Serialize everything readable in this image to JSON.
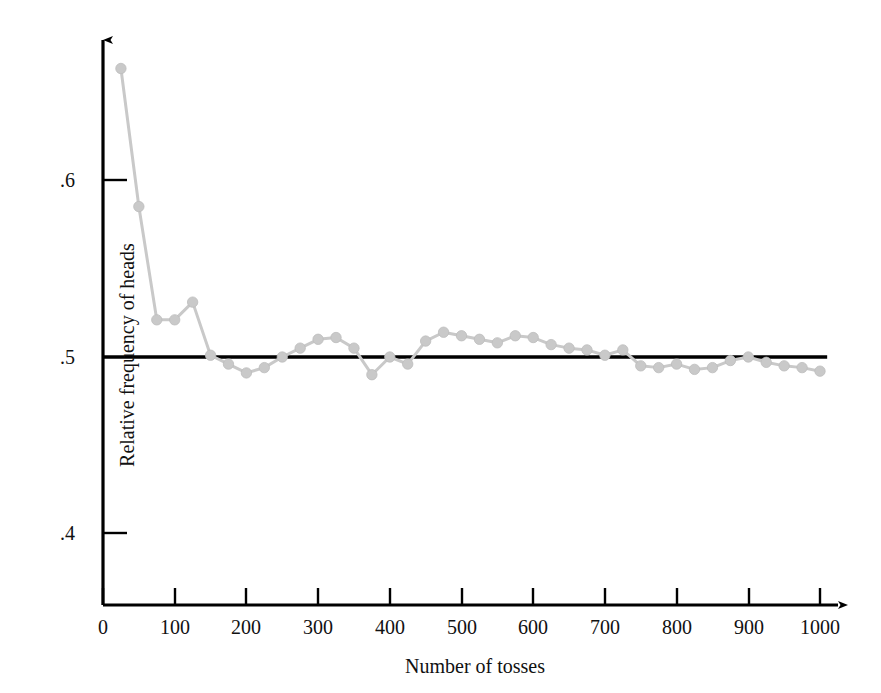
{
  "chart_data": {
    "type": "line",
    "title": "",
    "subtitle": "",
    "xlabel": "Number of tosses",
    "ylabel": "Relative frequency of heads",
    "xlim": [
      0,
      1040
    ],
    "ylim": [
      0.355,
      0.685
    ],
    "xticks": [
      0,
      100,
      200,
      300,
      400,
      500,
      600,
      700,
      800,
      900,
      1000
    ],
    "xtick_labels": [
      "0",
      "100",
      "200",
      "300",
      "400",
      "500",
      "600",
      "700",
      "800",
      "900",
      "1000"
    ],
    "yticks": [
      0.4,
      0.5,
      0.6
    ],
    "ytick_labels": [
      ".4",
      ".5",
      ".6"
    ],
    "grid": false,
    "legend": null,
    "reference_line": {
      "label": "0.5",
      "y": 0.5,
      "x_start": 0,
      "x_end": 1010,
      "color": "#000000"
    },
    "series": [
      {
        "name": "Relative frequency of heads",
        "color": "#c9c9c9",
        "marker": "circle",
        "x": [
          25,
          50,
          75,
          100,
          125,
          150,
          175,
          200,
          225,
          250,
          275,
          300,
          325,
          350,
          375,
          400,
          425,
          450,
          475,
          500,
          525,
          550,
          575,
          600,
          625,
          650,
          675,
          700,
          725,
          750,
          775,
          800,
          825,
          850,
          875,
          900,
          925,
          950,
          975,
          1000
        ],
        "y": [
          0.663,
          0.585,
          0.521,
          0.521,
          0.531,
          0.501,
          0.496,
          0.491,
          0.494,
          0.5,
          0.505,
          0.51,
          0.511,
          0.505,
          0.49,
          0.5,
          0.496,
          0.509,
          0.514,
          0.512,
          0.51,
          0.508,
          0.512,
          0.511,
          0.507,
          0.505,
          0.504,
          0.501,
          0.504,
          0.495,
          0.494,
          0.496,
          0.493,
          0.494,
          0.498,
          0.5,
          0.497,
          0.495,
          0.494,
          0.492
        ]
      }
    ]
  },
  "axes": {
    "x_arrow": true,
    "y_arrow": true,
    "axis_color": "#000000"
  }
}
